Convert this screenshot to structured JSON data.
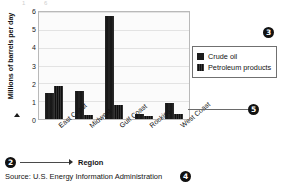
{
  "chart_data": {
    "type": "bar",
    "title": "",
    "xlabel": "Region",
    "ylabel": "Millions of barrels per day",
    "categories": [
      "East Coast",
      "Midwest",
      "Gulf Coast",
      "Rockies",
      "West Coast"
    ],
    "series": [
      {
        "name": "Crude oil",
        "values": [
          1.45,
          1.55,
          5.75,
          0.3,
          0.9
        ]
      },
      {
        "name": "Petroleum products",
        "values": [
          1.85,
          0.2,
          0.8,
          0.15,
          0.3
        ]
      }
    ],
    "ylim": [
      0,
      6
    ],
    "yticks": [
      0,
      1,
      2,
      3,
      4,
      5,
      6
    ],
    "grid": true,
    "legend_position": "right",
    "source": "Source: U.S. Energy Information Administration"
  },
  "axes": {
    "y_title": "Millions of barrels per day",
    "x_title": "Region",
    "y_tick_labels": [
      "6",
      "5",
      "4",
      "3",
      "2",
      "1",
      "0"
    ],
    "x_tick_labels": [
      "East Coast",
      "Midwest",
      "Gulf Coast",
      "Rockies",
      "West Coast"
    ]
  },
  "legend": {
    "items": [
      {
        "label": "Crude oil",
        "swatch": "solid-dark-square"
      },
      {
        "label": "Petroleum products",
        "swatch": "striped-dark-square"
      }
    ]
  },
  "source": {
    "text": "Source: U.S. Energy Information Administration"
  },
  "callouts": [
    {
      "id": "2",
      "label": "2",
      "points_to": "x-axis-title"
    },
    {
      "id": "3",
      "label": "3",
      "points_to": "legend"
    },
    {
      "id": "4",
      "label": "4",
      "points_to": "source-note"
    },
    {
      "id": "5",
      "label": "5",
      "points_to": "plot-area-right-edge"
    }
  ],
  "top_crop": {
    "a": "1",
    "b": "6"
  }
}
